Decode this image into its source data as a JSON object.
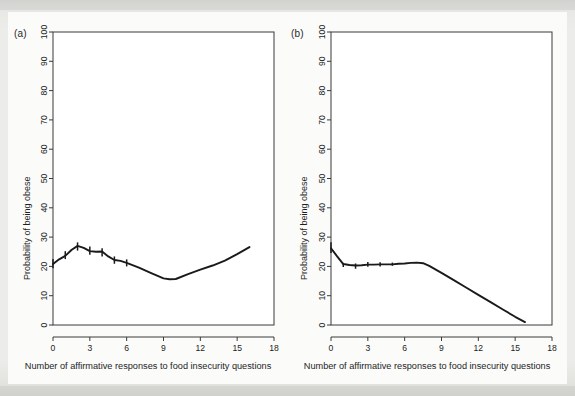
{
  "figure": {
    "background_color": "#e9e9e6",
    "panel_color": "#ffffff",
    "line_color": "#1a1a1a",
    "axis_color": "#3a3a3a"
  },
  "panels": [
    {
      "label": "(a)",
      "ylabel": "Probability of being obese",
      "xlabel": "Number of affirmative responses to food insecurity questions"
    },
    {
      "label": "(b)",
      "ylabel": "Probability of being obese",
      "xlabel": "Number of affirmative responses to food insecurity questions"
    }
  ],
  "chart_data": [
    {
      "type": "line",
      "panel": "(a)",
      "title": "",
      "xlabel": "Number of affirmative responses to food insecurity questions",
      "ylabel": "Probability of being obese",
      "xlim": [
        0,
        18
      ],
      "ylim": [
        0,
        100
      ],
      "xticks": [
        0,
        3,
        6,
        9,
        12,
        15,
        18
      ],
      "xtick_labels": [
        "0",
        "3",
        "6",
        "9",
        "12",
        "15",
        "18"
      ],
      "yticks": [
        0,
        10,
        20,
        30,
        40,
        50,
        60,
        70,
        80,
        90,
        100
      ],
      "ytick_labels": [
        "0",
        "10",
        "20",
        "30",
        "40",
        "50",
        "60",
        "70",
        "80",
        "90",
        "100"
      ],
      "grid": false,
      "legend": null,
      "x": [
        0,
        0.5,
        1,
        1.5,
        2,
        2.5,
        3,
        3.5,
        4,
        4.5,
        5,
        5.5,
        6,
        7,
        8,
        9,
        9.5,
        10,
        11,
        12,
        13,
        14,
        15,
        16
      ],
      "y": [
        20.8,
        22.4,
        23.6,
        25.6,
        27.0,
        26.3,
        25.2,
        25.0,
        25.1,
        23.4,
        22.2,
        21.9,
        21.2,
        19.6,
        17.7,
        15.9,
        15.6,
        15.7,
        17.4,
        18.9,
        20.3,
        22.0,
        24.2,
        26.6
      ],
      "error_bars": [
        {
          "x": 0,
          "low": 19.4,
          "high": 22.5
        },
        {
          "x": 1,
          "low": 22.5,
          "high": 25.2
        },
        {
          "x": 2,
          "low": 25.4,
          "high": 28.2
        },
        {
          "x": 3,
          "low": 24.0,
          "high": 26.8
        },
        {
          "x": 4,
          "low": 23.4,
          "high": 26.2
        },
        {
          "x": 5,
          "low": 20.9,
          "high": 23.4
        },
        {
          "x": 6,
          "low": 20.0,
          "high": 22.4
        }
      ]
    },
    {
      "type": "line",
      "panel": "(b)",
      "title": "",
      "xlabel": "Number of affirmative responses to food insecurity questions",
      "ylabel": "Probability of being obese",
      "xlim": [
        0,
        18
      ],
      "ylim": [
        0,
        100
      ],
      "xticks": [
        0,
        3,
        6,
        9,
        12,
        15,
        18
      ],
      "xtick_labels": [
        "0",
        "3",
        "6",
        "9",
        "12",
        "15",
        "18"
      ],
      "yticks": [
        0,
        10,
        20,
        30,
        40,
        50,
        60,
        70,
        80,
        90,
        100
      ],
      "ytick_labels": [
        "0",
        "10",
        "20",
        "30",
        "40",
        "50",
        "60",
        "70",
        "80",
        "90",
        "100"
      ],
      "grid": false,
      "legend": null,
      "x": [
        0,
        0.5,
        1,
        1.5,
        2,
        2.5,
        3,
        3.5,
        4,
        4.5,
        5,
        5.5,
        6,
        6.5,
        7,
        7.5,
        8,
        9,
        10,
        11,
        12,
        13,
        14,
        15,
        15.8
      ],
      "y": [
        26.2,
        23.4,
        20.8,
        20.5,
        20.3,
        20.4,
        20.6,
        20.6,
        20.7,
        20.7,
        20.7,
        20.9,
        21.0,
        21.2,
        21.3,
        21.1,
        20.2,
        17.8,
        15.3,
        12.8,
        10.3,
        7.8,
        5.3,
        2.8,
        1.0
      ],
      "error_bars": [
        {
          "x": 0,
          "low": 24.6,
          "high": 28.2
        },
        {
          "x": 1,
          "low": 19.8,
          "high": 21.2
        },
        {
          "x": 2,
          "low": 19.2,
          "high": 21.0
        },
        {
          "x": 3,
          "low": 19.9,
          "high": 21.5
        },
        {
          "x": 4,
          "low": 20.0,
          "high": 21.4
        },
        {
          "x": 5,
          "low": 20.2,
          "high": 21.3
        }
      ]
    }
  ]
}
